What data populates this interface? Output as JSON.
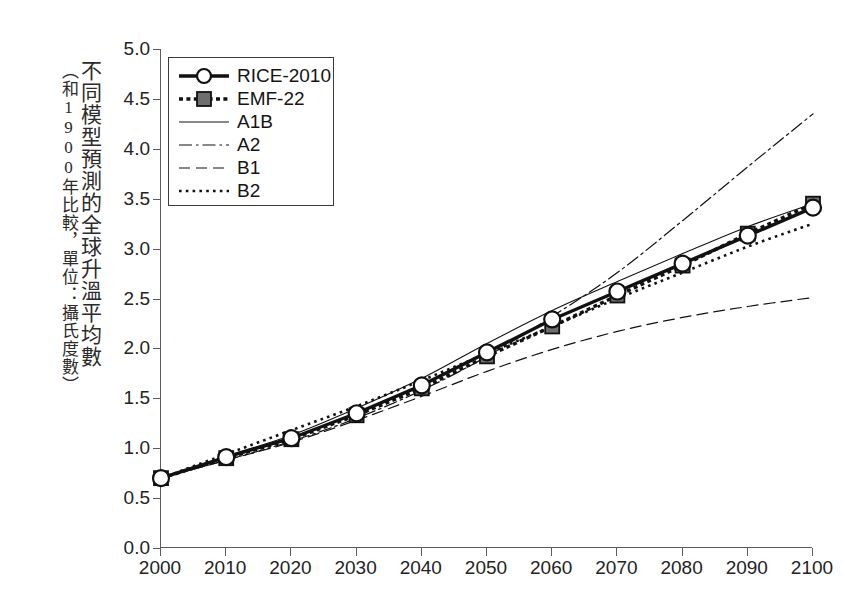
{
  "axis": {
    "ylabel_main": "不同模型預測的全球升溫平均數",
    "ylabel_sub": "（和1900年比較，單位：攝氏度數）"
  },
  "chart_data": {
    "type": "line",
    "title": "",
    "xlabel": "",
    "ylabel": "不同模型預測的全球升溫平均數（和1900年比較，單位：攝氏度數）",
    "x": [
      2000,
      2010,
      2020,
      2030,
      2040,
      2050,
      2060,
      2070,
      2080,
      2090,
      2100
    ],
    "xtick_labels": [
      "2000",
      "2010",
      "2020",
      "2030",
      "2040",
      "2050",
      "2060",
      "2070",
      "2080",
      "2090",
      "2100"
    ],
    "ytick_labels": [
      "0.0",
      "0.5",
      "1.0",
      "1.5",
      "2.0",
      "2.5",
      "3.0",
      "3.5",
      "4.0",
      "4.5",
      "5.0"
    ],
    "ytick_values": [
      0.0,
      0.5,
      1.0,
      1.5,
      2.0,
      2.5,
      3.0,
      3.5,
      4.0,
      4.5,
      5.0
    ],
    "xlim": [
      2000,
      2100
    ],
    "ylim": [
      0.0,
      5.0
    ],
    "grid": false,
    "legend_position": "upper left",
    "series": [
      {
        "name": "RICE-2010",
        "style": "solid-thick-circle",
        "marker": "open-circle",
        "values": [
          0.7,
          0.91,
          1.1,
          1.35,
          1.63,
          1.96,
          2.29,
          2.57,
          2.85,
          3.13,
          3.41
        ]
      },
      {
        "name": "EMF-22",
        "style": "dotted-thick-square",
        "marker": "filled-square",
        "values": [
          0.7,
          0.9,
          1.09,
          1.33,
          1.6,
          1.92,
          2.22,
          2.53,
          2.83,
          3.15,
          3.45
        ]
      },
      {
        "name": "A1B",
        "style": "solid-thin",
        "marker": "none",
        "values": [
          0.7,
          0.92,
          1.13,
          1.4,
          1.7,
          2.05,
          2.38,
          2.67,
          2.95,
          3.22,
          3.45
        ]
      },
      {
        "name": "A2",
        "style": "dash-dot",
        "marker": "none",
        "values": [
          0.7,
          0.88,
          1.07,
          1.3,
          1.58,
          1.92,
          2.32,
          2.76,
          3.28,
          3.82,
          4.35
        ]
      },
      {
        "name": "B1",
        "style": "dashed",
        "marker": "none",
        "values": [
          0.7,
          0.88,
          1.06,
          1.28,
          1.52,
          1.77,
          1.99,
          2.17,
          2.31,
          2.42,
          2.51
        ]
      },
      {
        "name": "B2",
        "style": "dotted",
        "marker": "none",
        "values": [
          0.7,
          0.94,
          1.18,
          1.42,
          1.68,
          1.95,
          2.22,
          2.5,
          2.76,
          3.02,
          3.25
        ]
      }
    ]
  },
  "legend": {
    "items": [
      {
        "label": "RICE-2010",
        "sample": "solid-thick-circle"
      },
      {
        "label": "EMF-22",
        "sample": "dotted-thick-square"
      },
      {
        "label": "A1B",
        "sample": "solid-thin"
      },
      {
        "label": "A2",
        "sample": "dash-dot"
      },
      {
        "label": "B1",
        "sample": "dashed"
      },
      {
        "label": "B2",
        "sample": "dotted"
      }
    ]
  }
}
